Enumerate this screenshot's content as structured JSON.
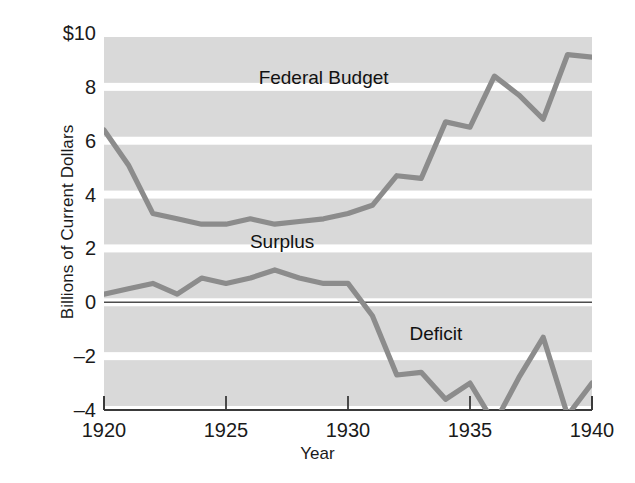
{
  "chart_data": {
    "type": "line",
    "title": "",
    "xlabel": "Year",
    "ylabel": "Billions of Current Dollars",
    "xlim": [
      1920,
      1940
    ],
    "ylim": [
      -4,
      10
    ],
    "xticks": [
      1920,
      1925,
      1930,
      1935,
      1940
    ],
    "xtick_labels": [
      "1920",
      "1925",
      "1930",
      "1935",
      "1940"
    ],
    "yticks": [
      -4,
      -2,
      0,
      2,
      4,
      6,
      8,
      10
    ],
    "ytick_labels": [
      "–4",
      "–2",
      "0",
      "2",
      "4",
      "6",
      "8",
      "$10"
    ],
    "grid": "horizontal-bands",
    "legend": "inline-annotations",
    "line_color": "#8c8c8c",
    "band_color": "#d9d9d9",
    "zero_line_color": "#4d4d4d",
    "x": [
      1920,
      1921,
      1922,
      1923,
      1924,
      1925,
      1926,
      1927,
      1928,
      1929,
      1930,
      1931,
      1932,
      1933,
      1934,
      1935,
      1936,
      1937,
      1938,
      1939,
      1940
    ],
    "series": [
      {
        "name": "Federal Budget",
        "label": "Federal Budget",
        "label_x": 1929.0,
        "label_y": 8.1,
        "values": [
          6.4,
          5.1,
          3.3,
          3.1,
          2.9,
          2.9,
          3.1,
          2.9,
          3.0,
          3.1,
          3.3,
          3.6,
          4.7,
          4.6,
          6.7,
          6.5,
          8.4,
          7.7,
          6.8,
          9.2,
          9.1
        ]
      },
      {
        "name": "Surplus or Deficit",
        "label_surplus": "Surplus",
        "label_deficit": "Deficit",
        "surplus_label_x": 1927.3,
        "surplus_label_y": 2.0,
        "deficit_label_x": 1933.6,
        "deficit_label_y": -1.4,
        "values": [
          0.3,
          0.5,
          0.7,
          0.3,
          0.9,
          0.7,
          0.9,
          1.2,
          0.9,
          0.7,
          0.7,
          -0.5,
          -2.7,
          -2.6,
          -3.6,
          -3.0,
          -4.5,
          -2.8,
          -1.3,
          -4.2,
          -3.0
        ]
      }
    ]
  },
  "annotations": {
    "federal_budget": "Federal Budget",
    "surplus": "Surplus",
    "deficit": "Deficit"
  }
}
